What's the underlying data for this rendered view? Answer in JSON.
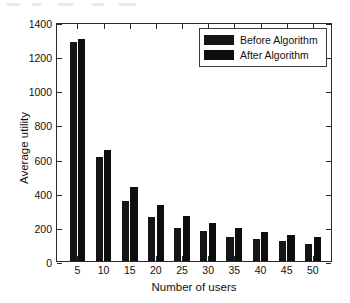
{
  "chart_data": {
    "type": "bar",
    "title": "",
    "xlabel": "Number of users",
    "ylabel": "Average utility",
    "categories": [
      "5",
      "10",
      "15",
      "20",
      "25",
      "30",
      "35",
      "40",
      "45",
      "50"
    ],
    "series": [
      {
        "name": "Before Algorithm",
        "color": "#151515",
        "values": [
          1285,
          610,
          350,
          260,
          195,
          178,
          140,
          128,
          120,
          100
        ]
      },
      {
        "name": "After Algorithm",
        "color": "#0d0d0d",
        "values": [
          1300,
          650,
          435,
          330,
          265,
          222,
          193,
          170,
          152,
          140
        ]
      }
    ],
    "ylim": [
      0,
      1400
    ],
    "yticks": [
      0,
      200,
      400,
      600,
      800,
      1000,
      1200,
      1400
    ],
    "ytick_labels": [
      "0",
      "200",
      "400",
      "600",
      "800",
      "1000",
      "1200",
      "1400"
    ],
    "xtick_labels": [
      "5",
      "10",
      "15",
      "20",
      "25",
      "30",
      "35",
      "40",
      "45",
      "50"
    ],
    "grid": false,
    "legend_position": "top-right",
    "legend_entries": [
      "Before Algorithm",
      "After Algorithm"
    ]
  },
  "axes": {
    "y_title": "Average utility",
    "x_title": "Number of users"
  },
  "legend": {
    "items": [
      {
        "label": "Before Algorithm"
      },
      {
        "label": "After Algorithm"
      }
    ]
  }
}
